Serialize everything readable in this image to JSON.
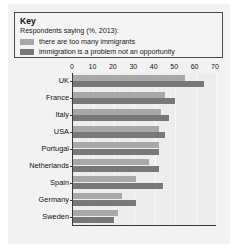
{
  "key": {
    "title": "Key",
    "subtitle": "Respondents saying (%, 2013):",
    "series": [
      {
        "label": "there are too many immigrants",
        "color": "#a8a8a8"
      },
      {
        "label": "immigration is a problem not an opportunity",
        "color": "#787878"
      }
    ]
  },
  "chart_data": {
    "type": "bar",
    "orientation": "horizontal",
    "title": "Key",
    "subtitle": "Respondents saying (%, 2013):",
    "xlabel": "",
    "ylabel": "",
    "xlim": [
      0,
      70
    ],
    "xticks": [
      0,
      10,
      20,
      30,
      40,
      50,
      60,
      70
    ],
    "grid": true,
    "legend_position": "top",
    "categories": [
      "UK",
      "France",
      "Italy",
      "USA",
      "Portugal",
      "Netherlands",
      "Spain",
      "Germany",
      "Sweden"
    ],
    "series": [
      {
        "name": "there are too many immigrants",
        "color": "#a8a8a8",
        "values": [
          55,
          45,
          43,
          42,
          42,
          37,
          31,
          24,
          22
        ]
      },
      {
        "name": "immigration is a problem not an opportunity",
        "color": "#787878",
        "values": [
          64,
          50,
          47,
          45,
          42,
          42,
          44,
          31,
          20
        ]
      }
    ]
  }
}
